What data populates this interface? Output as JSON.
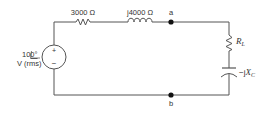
{
  "diagram": {
    "type": "circuit-schematic",
    "source": {
      "magnitude": "10",
      "angle": "0°",
      "units": "V (rms)",
      "plus": "+",
      "minus": "−"
    },
    "series_resistor": {
      "label": "3000 Ω"
    },
    "series_inductor": {
      "label": "j4000 Ω"
    },
    "load_resistor": {
      "symbol": "R",
      "subscript": "L"
    },
    "load_capacitor": {
      "prefix": "−j",
      "symbol": "X",
      "subscript": "C"
    },
    "nodes": {
      "a": "a",
      "b": "b"
    },
    "colors": {
      "wire": "#555555",
      "node": "#111111",
      "text": "#333333"
    }
  }
}
